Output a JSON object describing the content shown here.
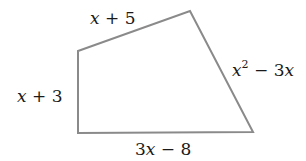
{
  "diagram": {
    "type": "quadrilateral",
    "stroke_color": "#8a8a8a",
    "stroke_width": 2,
    "vertices": [
      {
        "name": "top-left",
        "x": 78,
        "y": 51
      },
      {
        "name": "top-right",
        "x": 190,
        "y": 11
      },
      {
        "name": "bottom-right",
        "x": 253,
        "y": 132
      },
      {
        "name": "bottom-left",
        "x": 78,
        "y": 133
      }
    ],
    "sides": [
      {
        "name": "top",
        "label": "x + 5",
        "var": "x",
        "rest": " + 5"
      },
      {
        "name": "right",
        "label": "x² − 3x",
        "var": "x",
        "exp": "2",
        "rest": " − 3",
        "var2": "x"
      },
      {
        "name": "bottom",
        "label": "3x − 8",
        "pre": "3",
        "var": "x",
        "rest": " − 8"
      },
      {
        "name": "left",
        "label": "x + 3",
        "var": "x",
        "rest": " + 3"
      }
    ]
  }
}
